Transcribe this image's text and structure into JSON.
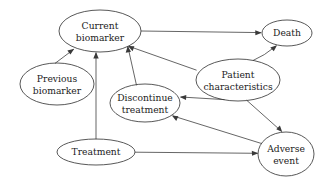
{
  "diagram": {
    "type": "directed-acyclic-graph",
    "title": "",
    "background_color": "#ffffff",
    "node_stroke_color": "#3a3a3a",
    "edge_stroke_color": "#4a4a4a",
    "text_color": "#1c1c1c",
    "nodes": [
      {
        "id": "current_biomarker",
        "label_line1": "Current",
        "label_line2": "biomarker",
        "cx": 100,
        "cy": 31,
        "rx": 41,
        "ry": 21
      },
      {
        "id": "previous_biomarker",
        "label_line1": "Previous",
        "label_line2": "biomarker",
        "cx": 57,
        "cy": 84,
        "rx": 37,
        "ry": 21
      },
      {
        "id": "discontinue_treatment",
        "label_line1": "Discontinue",
        "label_line2": "treatment",
        "cx": 145,
        "cy": 103,
        "rx": 35,
        "ry": 19
      },
      {
        "id": "patient_characteristics",
        "label_line1": "Patient",
        "label_line2": "characteristics",
        "cx": 238,
        "cy": 80,
        "rx": 42,
        "ry": 21
      },
      {
        "id": "death",
        "label_line1": "Death",
        "label_line2": "",
        "cx": 287,
        "cy": 33,
        "rx": 25,
        "ry": 13
      },
      {
        "id": "adverse_event",
        "label_line1": "Adverse",
        "label_line2": "event",
        "cx": 286,
        "cy": 154,
        "rx": 28,
        "ry": 22
      },
      {
        "id": "treatment",
        "label_line1": "Treatment",
        "label_line2": "",
        "cx": 96,
        "cy": 152,
        "rx": 39,
        "ry": 13
      }
    ],
    "edges": [
      {
        "id": "e1",
        "from": "current_biomarker",
        "to": "death",
        "label": ""
      },
      {
        "id": "e2",
        "from": "previous_biomarker",
        "to": "current_biomarker",
        "label": ""
      },
      {
        "id": "e3",
        "from": "treatment",
        "to": "current_biomarker",
        "label": ""
      },
      {
        "id": "e4",
        "from": "discontinue_treatment",
        "to": "current_biomarker",
        "label": ""
      },
      {
        "id": "e5",
        "from": "patient_characteristics",
        "to": "current_biomarker",
        "label": ""
      },
      {
        "id": "e6",
        "from": "patient_characteristics",
        "to": "death",
        "label": ""
      },
      {
        "id": "e7",
        "from": "patient_characteristics",
        "to": "discontinue_treatment",
        "label": ""
      },
      {
        "id": "e8",
        "from": "patient_characteristics",
        "to": "adverse_event",
        "label": ""
      },
      {
        "id": "e9",
        "from": "adverse_event",
        "to": "discontinue_treatment",
        "label": ""
      },
      {
        "id": "e10",
        "from": "treatment",
        "to": "adverse_event",
        "label": ""
      }
    ]
  }
}
